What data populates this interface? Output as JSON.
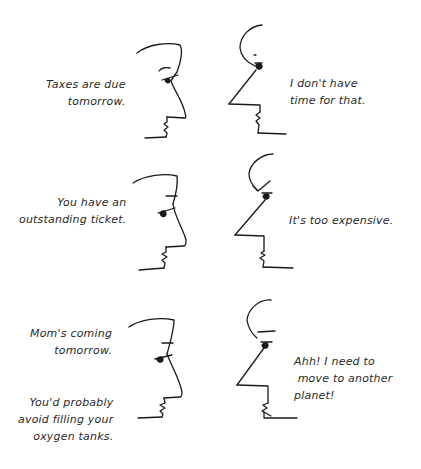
{
  "panels": [
    {
      "left_speech": "Taxes are due\n tomorrow.",
      "right_speech": "I don't have\ntime for that."
    },
    {
      "left_speech": "You have an\noutstanding ticket.",
      "right_speech": "It's too expensive."
    },
    {
      "left_speech": "Mom's coming\n tomorrow.",
      "left_speech_2": "You'd probably\navoid filling your\n oxygen tanks.",
      "right_speech": "Ahh! I need to\n move to another\nplanet!"
    }
  ],
  "colors": {
    "background": "#ffffff",
    "ink": "#1a1a1a"
  }
}
